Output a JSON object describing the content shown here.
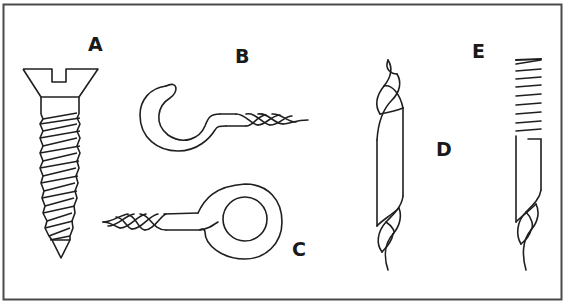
{
  "figure": {
    "frame_color": "#4a4a4a",
    "ink_color": "#1f1f1f",
    "background": "#ffffff",
    "items": [
      {
        "id": "A",
        "label": "A",
        "description": "flat-head slotted wood screw"
      },
      {
        "id": "B",
        "label": "B",
        "description": "screw hook"
      },
      {
        "id": "C",
        "label": "C",
        "description": "screw eye"
      },
      {
        "id": "D",
        "label": "D",
        "description": "twisted rod"
      },
      {
        "id": "E",
        "label": "E",
        "description": "ruled / notched rod with twisted end"
      }
    ]
  }
}
